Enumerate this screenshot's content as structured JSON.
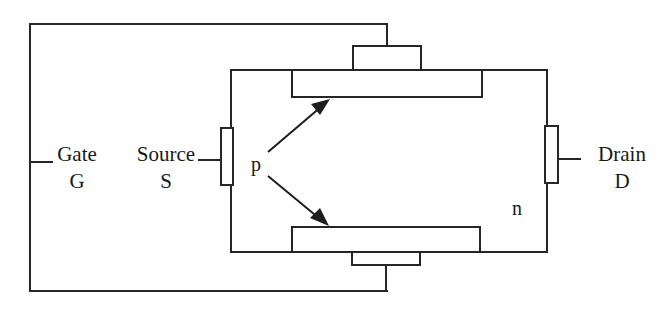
{
  "diagram": {
    "colors": {
      "line": "#262626",
      "background": "#ffffff",
      "text": "#1a1a1a"
    },
    "labels": {
      "gate_name": "Gate",
      "gate_symbol": "G",
      "source_name": "Source",
      "source_symbol": "S",
      "drain_name": "Drain",
      "drain_symbol": "D",
      "p_region": "p",
      "n_region": "n"
    },
    "regions": [
      {
        "id": "channel-body",
        "label": "n",
        "type": "semiconductor-body"
      },
      {
        "id": "p-region-top",
        "label": "p",
        "type": "gate-region"
      },
      {
        "id": "p-region-bottom",
        "label": "p",
        "type": "gate-region"
      }
    ],
    "terminals": [
      {
        "id": "gate",
        "name": "Gate",
        "symbol": "G",
        "side": "left"
      },
      {
        "id": "source",
        "name": "Source",
        "symbol": "S",
        "side": "left"
      },
      {
        "id": "drain",
        "name": "Drain",
        "symbol": "D",
        "side": "right"
      }
    ],
    "annotations": [
      {
        "id": "p-arrow-upper",
        "from": "p",
        "to": "p-region-top"
      },
      {
        "id": "p-arrow-lower",
        "from": "p",
        "to": "p-region-bottom"
      }
    ]
  }
}
